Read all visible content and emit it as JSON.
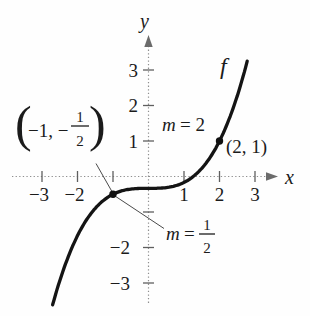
{
  "chart_data": {
    "type": "line",
    "title": "",
    "xlabel": "x",
    "ylabel": "y",
    "grid": false,
    "x_ticks": [
      {
        "v": -3,
        "label": "−3"
      },
      {
        "v": -2,
        "label": "−2"
      },
      {
        "v": -1,
        "label": ""
      },
      {
        "v": 1,
        "label": "1"
      },
      {
        "v": 2,
        "label": "2"
      },
      {
        "v": 3,
        "label": "3"
      }
    ],
    "y_ticks": [
      {
        "v": 3,
        "label": "3"
      },
      {
        "v": 2,
        "label": "2"
      },
      {
        "v": 1,
        "label": "1"
      },
      {
        "v": -1,
        "label": ""
      },
      {
        "v": -2,
        "label": "−2"
      },
      {
        "v": -3,
        "label": "−3"
      }
    ],
    "curve": {
      "label": "f",
      "poly_coeffs": [
        -0.3333333,
        0,
        0,
        0.1666667
      ],
      "x_domain": [
        -2.7,
        2.8
      ]
    },
    "marked_points": [
      {
        "x": -1,
        "y": -0.5,
        "point_label": "(−1, −1/2)",
        "slope": 0.5,
        "slope_label": "m = 1/2"
      },
      {
        "x": 2,
        "y": 1,
        "point_label": "(2, 1)",
        "slope": 2,
        "slope_label": "m = 2"
      }
    ]
  },
  "labels": {
    "point1": {
      "open": "(",
      "body": "−1, −",
      "num": "1",
      "den": "2",
      "close": ")"
    },
    "point2": "(2, 1)",
    "slope2": {
      "var_name": "m",
      "rest": "= 2"
    },
    "slope1": {
      "var_name": "m",
      "eq": "=",
      "num": "1",
      "den": "2"
    }
  }
}
